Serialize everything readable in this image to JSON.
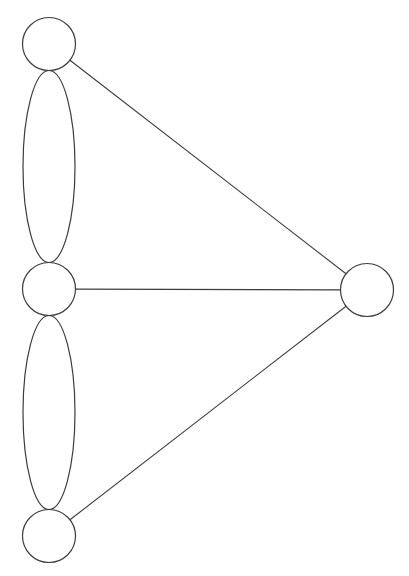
{
  "diagram": {
    "type": "graph",
    "colors": {
      "background": "#ffffff",
      "stroke": "#3c3c3c"
    },
    "nodes": [
      {
        "id": "top-left",
        "label": ""
      },
      {
        "id": "middle-left",
        "label": ""
      },
      {
        "id": "bottom-left",
        "label": ""
      },
      {
        "id": "right",
        "label": ""
      }
    ],
    "edges": [
      {
        "from": "top-left",
        "to": "middle-left",
        "style": "ellipse"
      },
      {
        "from": "middle-left",
        "to": "bottom-left",
        "style": "ellipse"
      },
      {
        "from": "top-left",
        "to": "right",
        "style": "line"
      },
      {
        "from": "middle-left",
        "to": "right",
        "style": "line"
      },
      {
        "from": "bottom-left",
        "to": "right",
        "style": "line"
      }
    ]
  }
}
